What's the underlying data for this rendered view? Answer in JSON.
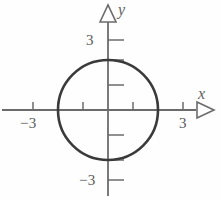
{
  "figure": {
    "type": "coordinate-plane-diagram",
    "width": 221,
    "height": 200,
    "background_color": "#fefefe"
  },
  "axes": {
    "x_label": "x",
    "y_label": "y",
    "axis_color": "#6b6b6b",
    "origin_px": {
      "x": 108,
      "y": 110
    },
    "pixels_per_unit": 25,
    "x_range": [
      -4.3,
      4.5
    ],
    "y_range": [
      -3.6,
      4.4
    ],
    "arrow_style": "hollow-triangle",
    "x_tick_values": [
      -3,
      -2,
      -1,
      1,
      2,
      3
    ],
    "y_tick_values": [
      3,
      2,
      1,
      -1,
      -2,
      -3
    ],
    "x_tick_labels": [
      {
        "value": -3,
        "text": "−3"
      },
      {
        "value": 3,
        "text": "3"
      }
    ],
    "y_tick_labels": [
      {
        "value": 3,
        "text": "3"
      },
      {
        "value": -3,
        "text": "−3"
      }
    ]
  },
  "chart_data": {
    "type": "scatter",
    "title": "",
    "xlabel": "x",
    "ylabel": "y",
    "xlim": [
      -4.3,
      4.5
    ],
    "ylim": [
      -3.6,
      4.4
    ],
    "grid": false,
    "legend": null,
    "shapes": [
      {
        "kind": "circle",
        "center": [
          0,
          0
        ],
        "radius": 2,
        "equation": "x^2 + y^2 = 4",
        "stroke_color": "#3a3a3a",
        "stroke_width": 2.6,
        "fill": "none"
      }
    ],
    "x_ticks": [
      -3,
      -2,
      -1,
      1,
      2,
      3
    ],
    "y_ticks": [
      -3,
      -2,
      -1,
      1,
      2,
      3
    ],
    "x_tick_text": [
      "−3",
      "",
      "",
      "",
      "",
      "3"
    ],
    "y_tick_text": [
      "−3",
      "",
      "",
      "",
      "",
      "3"
    ]
  },
  "labels": {
    "y_axis_name": "y",
    "x_axis_name": "x",
    "y_positive_three": "3",
    "y_negative_three": "−3",
    "x_negative_three": "−3",
    "x_positive_three": "3"
  },
  "colors": {
    "axis": "#6b6b6b",
    "curve": "#3a3a3a",
    "text": "#5a5a5a",
    "background": "#fefefe"
  }
}
